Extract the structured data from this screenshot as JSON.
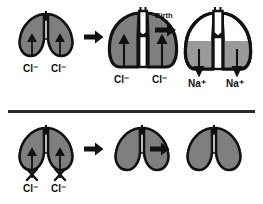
{
  "figure": {
    "colors": {
      "outline": "#111111",
      "tissue_fill": "#7f7f7f",
      "fluid_fill": "#9a9a9a",
      "airspace_fill": "#ffffff",
      "background": "#ffffff",
      "divider": "#2b2b2b",
      "arrow": "#111111"
    }
  },
  "top_row": {
    "name": "before-and-at-birth-sequence",
    "stages": [
      {
        "id": "stage-1",
        "lung_state": "small-fluid-filled-lung",
        "ion_labels": [
          {
            "ion": "Cl",
            "charge": "−",
            "text": "Cl⁻"
          },
          {
            "ion": "Cl",
            "charge": "−",
            "text": "Cl⁻"
          }
        ],
        "arrow_direction": "up-into-lung",
        "blocked": false
      },
      {
        "id": "stage-2",
        "lung_state": "expanded-fluid-filled-lung",
        "ion_labels": [
          {
            "ion": "Cl",
            "charge": "−",
            "text": "Cl⁻"
          },
          {
            "ion": "Cl",
            "charge": "−",
            "text": "Cl⁻"
          }
        ],
        "arrow_direction": "up-into-lung",
        "blocked": false
      },
      {
        "id": "stage-3",
        "lung_state": "air-filled-lung-with-residual-fluid",
        "ion_labels": [
          {
            "ion": "Na",
            "charge": "+",
            "text": "Na⁺"
          },
          {
            "ion": "Na",
            "charge": "+",
            "text": "Na⁺"
          }
        ],
        "arrow_direction": "down-out-of-lung",
        "blocked": false
      }
    ],
    "transitions": [
      {
        "id": "arrow-1",
        "label": ""
      },
      {
        "id": "arrow-2",
        "label": "Birth"
      }
    ]
  },
  "bottom_row": {
    "name": "blocked-chloride-secretion-sequence",
    "stages": [
      {
        "id": "stage-4",
        "lung_state": "small-lung",
        "ion_labels": [
          {
            "ion": "Cl",
            "charge": "−",
            "text": "Cl⁻"
          },
          {
            "ion": "Cl",
            "charge": "−",
            "text": "Cl⁻"
          }
        ],
        "arrow_direction": "up-into-lung",
        "blocked": true,
        "block_marker": "x-cross"
      },
      {
        "id": "stage-5",
        "lung_state": "small-lung",
        "ion_labels": [],
        "arrow_direction": "none",
        "blocked": false
      },
      {
        "id": "stage-6",
        "lung_state": "small-lung",
        "ion_labels": [],
        "arrow_direction": "none",
        "blocked": false
      }
    ],
    "transitions": [
      {
        "id": "arrow-3",
        "label": ""
      },
      {
        "id": "arrow-4",
        "label": ""
      }
    ]
  }
}
